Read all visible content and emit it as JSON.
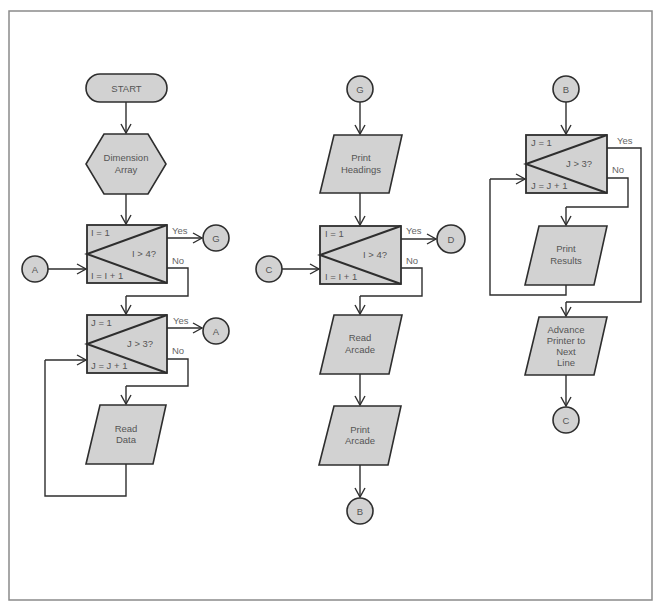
{
  "diagram": {
    "type": "program-flowchart",
    "columns": [
      {
        "id": "column-1",
        "nodes": [
          {
            "id": "start",
            "shape": "terminal",
            "lines": [
              "START"
            ]
          },
          {
            "id": "dim-array",
            "shape": "preparation",
            "lines": [
              "Dimension",
              "Array"
            ]
          },
          {
            "id": "loop-i-1",
            "shape": "loop-box",
            "init": "I = 1",
            "test": "I > 4?",
            "incr": "I = I + 1",
            "yes_label": "Yes",
            "no_label": "No",
            "yes_target": "G",
            "entry_connector": "A"
          },
          {
            "id": "loop-j-1",
            "shape": "loop-box",
            "init": "J = 1",
            "test": "J > 3?",
            "incr": "J = J + 1",
            "yes_label": "Yes",
            "no_label": "No",
            "yes_target": "A"
          },
          {
            "id": "read-data",
            "shape": "io",
            "lines": [
              "Read",
              "Data"
            ]
          }
        ]
      },
      {
        "id": "column-2",
        "nodes": [
          {
            "id": "conn-g",
            "shape": "connector",
            "label": "G"
          },
          {
            "id": "print-headings",
            "shape": "io",
            "lines": [
              "Print",
              "Headings"
            ]
          },
          {
            "id": "loop-i-2",
            "shape": "loop-box",
            "init": "I = 1",
            "test": "I > 4?",
            "incr": "I = I + 1",
            "yes_label": "Yes",
            "no_label": "No",
            "yes_target": "D",
            "entry_connector": "C"
          },
          {
            "id": "read-arcade",
            "shape": "io",
            "lines": [
              "Read",
              "Arcade"
            ]
          },
          {
            "id": "print-arcade",
            "shape": "io",
            "lines": [
              "Print",
              "Arcade"
            ]
          },
          {
            "id": "conn-b-out",
            "shape": "connector",
            "label": "B"
          }
        ]
      },
      {
        "id": "column-3",
        "nodes": [
          {
            "id": "conn-b-in",
            "shape": "connector",
            "label": "B"
          },
          {
            "id": "loop-j-2",
            "shape": "loop-box",
            "init": "J = 1",
            "test": "J > 3?",
            "incr": "J = J + 1",
            "yes_label": "Yes",
            "no_label": "No"
          },
          {
            "id": "print-results",
            "shape": "io",
            "lines": [
              "Print",
              "Results"
            ]
          },
          {
            "id": "advance-printer",
            "shape": "io",
            "lines": [
              "Advance",
              "Printer to",
              "Next",
              "Line"
            ]
          },
          {
            "id": "conn-c-out",
            "shape": "connector",
            "label": "C"
          }
        ]
      }
    ],
    "connectors": {
      "g_out": "G",
      "a_in": "A",
      "a_out": "A",
      "c_in": "C",
      "d_out": "D"
    }
  }
}
